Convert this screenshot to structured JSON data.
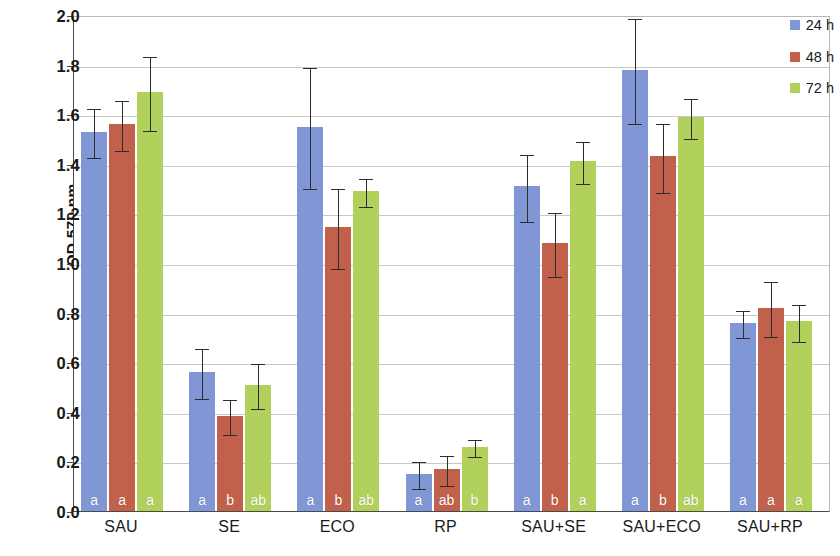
{
  "chart_data": {
    "type": "bar",
    "title": "",
    "xlabel": "",
    "ylabel": "OD 570 nm",
    "ylim": [
      0.0,
      2.0
    ],
    "ytick_step": 0.2,
    "ytick_labels": [
      "2.0",
      "1.8",
      "1.6",
      "1.4",
      "1.2",
      "1.0",
      "0.8",
      "0.6",
      "0.4",
      "0.2",
      "0.0"
    ],
    "ytick_values": [
      2.0,
      1.8,
      1.6,
      1.4,
      1.2,
      1.0,
      0.8,
      0.6,
      0.4,
      0.2,
      0.0
    ],
    "grid": true,
    "legend_position": "top-right",
    "categories": [
      "SAU",
      "SE",
      "ECO",
      "RP",
      "SAU+SE",
      "SAU+ECO",
      "SAU+RP"
    ],
    "series": [
      {
        "name": "24 h",
        "color": "#8196d4",
        "values": [
          1.53,
          0.56,
          1.55,
          0.15,
          1.31,
          1.78,
          0.76
        ],
        "errors": [
          0.1,
          0.1,
          0.245,
          0.055,
          0.135,
          0.21,
          0.055
        ],
        "letters": [
          "a",
          "a",
          "a",
          "a",
          "a",
          "a",
          "a"
        ]
      },
      {
        "name": "48 h",
        "color": "#c1604b",
        "values": [
          1.56,
          0.385,
          1.145,
          0.17,
          1.08,
          1.43,
          0.82
        ],
        "errors": [
          0.1,
          0.07,
          0.16,
          0.06,
          0.13,
          0.14,
          0.11
        ],
        "letters": [
          "a",
          "b",
          "b",
          "ab",
          "b",
          "b",
          "a"
        ]
      },
      {
        "name": "72 h",
        "color": "#b2d05c",
        "values": [
          1.69,
          0.51,
          1.29,
          0.26,
          1.41,
          1.59,
          0.765
        ],
        "errors": [
          0.15,
          0.09,
          0.055,
          0.035,
          0.085,
          0.08,
          0.075
        ],
        "letters": [
          "a",
          "ab",
          "ab",
          "b",
          "a",
          "ab",
          "a"
        ]
      }
    ]
  },
  "legend": {
    "items": [
      {
        "label": "24 h",
        "color": "#8196d4"
      },
      {
        "label": "48 h",
        "color": "#c1604b"
      },
      {
        "label": "72 h",
        "color": "#b2d05c"
      }
    ]
  }
}
